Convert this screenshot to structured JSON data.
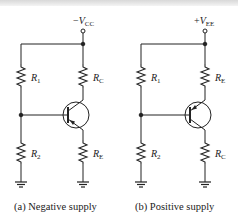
{
  "figure": {
    "circuits": [
      {
        "id": "a",
        "supply": {
          "sign": "−",
          "symbol": "V",
          "sub": "CC"
        },
        "resistors": {
          "top_left": {
            "symbol": "R",
            "sub": "1"
          },
          "bottom_left": {
            "symbol": "R",
            "sub": "2"
          },
          "top_right": {
            "symbol": "R",
            "sub": "C"
          },
          "bottom_right": {
            "symbol": "R",
            "sub": "E"
          }
        },
        "transistor": "pnp",
        "emitter_side": "bottom",
        "caption": "(a)  Negative supply"
      },
      {
        "id": "b",
        "supply": {
          "sign": "+",
          "symbol": "V",
          "sub": "EE"
        },
        "resistors": {
          "top_left": {
            "symbol": "R",
            "sub": "1"
          },
          "bottom_left": {
            "symbol": "R",
            "sub": "2"
          },
          "top_right": {
            "symbol": "R",
            "sub": "E"
          },
          "bottom_right": {
            "symbol": "R",
            "sub": "C"
          }
        },
        "transistor": "pnp",
        "emitter_side": "top",
        "caption": "(b)  Positive supply"
      }
    ],
    "colors": {
      "line": "#222222",
      "background": "#ffffff"
    }
  }
}
